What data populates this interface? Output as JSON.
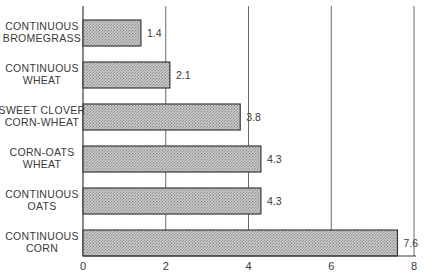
{
  "chart_data": {
    "type": "bar",
    "orientation": "horizontal",
    "title": "",
    "xlabel": "",
    "ylabel": "",
    "categories": [
      [
        "CONTINUOUS",
        "BROMEGRASS"
      ],
      [
        "CONTINUOUS",
        "WHEAT"
      ],
      [
        "SWEET CLOVER",
        "CORN-WHEAT"
      ],
      [
        "CORN-OATS",
        "WHEAT"
      ],
      [
        "CONTINUOUS",
        "OATS"
      ],
      [
        "CONTINUOUS",
        "CORN"
      ]
    ],
    "values": [
      1.4,
      2.1,
      3.8,
      4.3,
      4.3,
      7.6
    ],
    "value_labels": [
      "1.4",
      "2.1",
      "3.8",
      "4.3",
      "4.3",
      "7.6"
    ],
    "xlim": [
      0,
      8
    ],
    "xticks": [
      0,
      2,
      4,
      6,
      8
    ],
    "xtick_labels": [
      "0",
      "2",
      "4",
      "6",
      "8"
    ],
    "grid": "vertical",
    "legend": "none",
    "bar_fill": "stippled gray",
    "colors": {
      "bar": "#bdbdbd",
      "stipple": "#8e8e8e",
      "ink": "#3a3a3a"
    }
  }
}
